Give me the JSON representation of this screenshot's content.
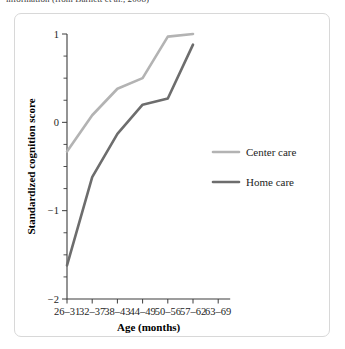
{
  "caption": {
    "text": "information (from Barnett et al., 2008)"
  },
  "chart_data": {
    "type": "line",
    "title": "",
    "xlabel": "Age (months)",
    "ylabel": "Standardized cognition score",
    "categories": [
      "26–31",
      "32–37",
      "38–43",
      "44–49",
      "50–56",
      "57–62",
      "63–69"
    ],
    "ylim": [
      -2,
      1
    ],
    "yticks": [
      1,
      0,
      -1,
      -2
    ],
    "ytick_labels": [
      "1",
      "0",
      "−1",
      "−2"
    ],
    "minor_ytick_step": 0.25,
    "grid": false,
    "legend_position": "right-middle",
    "series": [
      {
        "name": "Center care",
        "color": "#b3b3b3",
        "width": 2.6,
        "x": [
          "26–31",
          "32–37",
          "38–43",
          "44–49",
          "50–56",
          "57–62"
        ],
        "values": [
          -0.33,
          0.08,
          0.38,
          0.5,
          0.97,
          1.0
        ]
      },
      {
        "name": "Home care",
        "color": "#6d6d6d",
        "width": 2.6,
        "x": [
          "26–31",
          "32–37",
          "38–43",
          "44–49",
          "50–56",
          "57–62"
        ],
        "values": [
          -1.62,
          -0.62,
          -0.13,
          0.2,
          0.27,
          0.88
        ]
      }
    ]
  }
}
